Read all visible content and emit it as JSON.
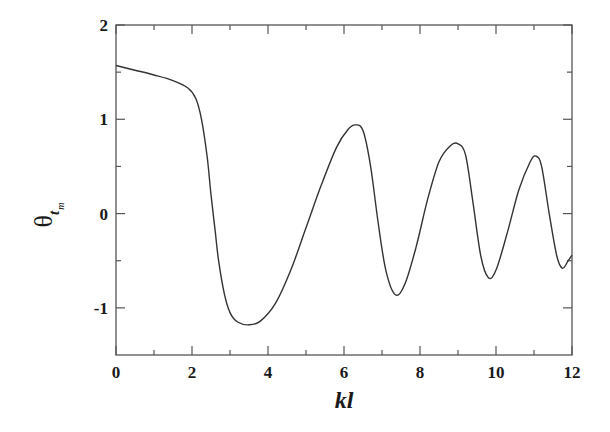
{
  "chart_data": {
    "type": "line",
    "title": "",
    "xlabel": "kl",
    "ylabel": "θ_t_m",
    "ylabel_parts": {
      "main": "θ",
      "sub": "t",
      "subsub": "m"
    },
    "xlim": [
      0,
      12
    ],
    "ylim": [
      -1.5,
      2
    ],
    "x_ticks": [
      0,
      2,
      4,
      6,
      8,
      10,
      12
    ],
    "x_tick_labels": [
      "0",
      "2",
      "4",
      "6",
      "8",
      "10",
      "12"
    ],
    "x_minor_ticks": [
      1,
      3,
      5,
      7,
      9,
      11
    ],
    "y_ticks": [
      -1,
      0,
      1,
      2
    ],
    "y_tick_labels": [
      "-1",
      "0",
      "1",
      "2"
    ],
    "y_minor_ticks": [
      -0.5,
      0.5,
      1.5
    ],
    "grid": false,
    "legend": null,
    "series": [
      {
        "name": "theta_tm",
        "color": "#333333",
        "x": [
          0,
          0.5,
          1.0,
          1.5,
          1.9,
          2.1,
          2.25,
          2.4,
          2.5,
          2.6,
          2.7,
          2.85,
          3.0,
          3.2,
          3.5,
          3.8,
          4.2,
          4.6,
          5.0,
          5.4,
          5.8,
          6.1,
          6.3,
          6.5,
          6.7,
          6.9,
          7.1,
          7.35,
          7.6,
          7.9,
          8.2,
          8.5,
          8.8,
          9.0,
          9.2,
          9.4,
          9.6,
          9.8,
          10.0,
          10.3,
          10.6,
          10.9,
          11.05,
          11.2,
          11.4,
          11.6,
          11.75,
          11.9,
          12.0
        ],
        "y": [
          1.57,
          1.52,
          1.47,
          1.41,
          1.33,
          1.22,
          1.0,
          0.6,
          0.2,
          -0.15,
          -0.5,
          -0.85,
          -1.05,
          -1.15,
          -1.18,
          -1.14,
          -0.95,
          -0.6,
          -0.15,
          0.3,
          0.7,
          0.89,
          0.94,
          0.88,
          0.5,
          -0.1,
          -0.6,
          -0.86,
          -0.75,
          -0.35,
          0.15,
          0.55,
          0.72,
          0.74,
          0.62,
          0.1,
          -0.45,
          -0.68,
          -0.6,
          -0.2,
          0.25,
          0.55,
          0.61,
          0.5,
          0.0,
          -0.45,
          -0.58,
          -0.5,
          -0.44
        ]
      }
    ]
  }
}
